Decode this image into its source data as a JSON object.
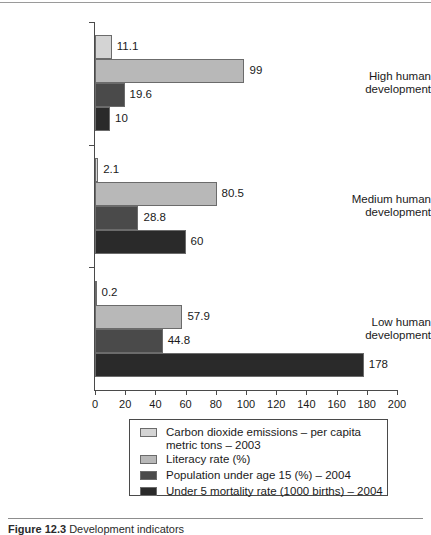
{
  "figure": {
    "caption_label": "Figure 12.3",
    "caption_text": "Development indicators"
  },
  "chart_data": {
    "type": "bar",
    "orientation": "horizontal",
    "title": "",
    "xlabel": "",
    "ylabel": "",
    "xlim": [
      0,
      200
    ],
    "xticks": [
      0,
      20,
      40,
      60,
      80,
      100,
      120,
      140,
      160,
      180,
      200
    ],
    "grid": false,
    "legend_position": "bottom",
    "categories": [
      "High human development",
      "Medium human development",
      "Low human development"
    ],
    "series": [
      {
        "name": "Carbon dioxide emissions – per capita metric tons – 2003",
        "color": "#d4d4d4",
        "values": [
          11.1,
          2.1,
          0.2
        ],
        "labels": [
          "11.1",
          "2.1",
          "0.2"
        ]
      },
      {
        "name": "Literacy rate (%)",
        "color": "#b8b8b8",
        "values": [
          99,
          80.5,
          57.9
        ],
        "labels": [
          "99",
          "80.5",
          "57.9"
        ]
      },
      {
        "name": "Population under age 15 (%) – 2004",
        "color": "#4a4a4a",
        "values": [
          19.6,
          28.8,
          44.8
        ],
        "labels": [
          "19.6",
          "28.8",
          "44.8"
        ]
      },
      {
        "name": "Under 5 mortality rate (1000 births) – 2004",
        "color": "#2a2a2a",
        "values": [
          10,
          60,
          178
        ],
        "labels": [
          "10",
          "60",
          "178"
        ]
      }
    ],
    "legend_entries": [
      "Carbon dioxide emissions – per capita\nmetric tons – 2003",
      "Literacy rate (%)",
      "Population under age 15 (%) – 2004",
      "Under 5 mortality rate (1000 births) – 2004"
    ],
    "category_label_lines": [
      [
        "High human",
        "development"
      ],
      [
        "Medium human",
        "development"
      ],
      [
        "Low human",
        "development"
      ]
    ]
  }
}
